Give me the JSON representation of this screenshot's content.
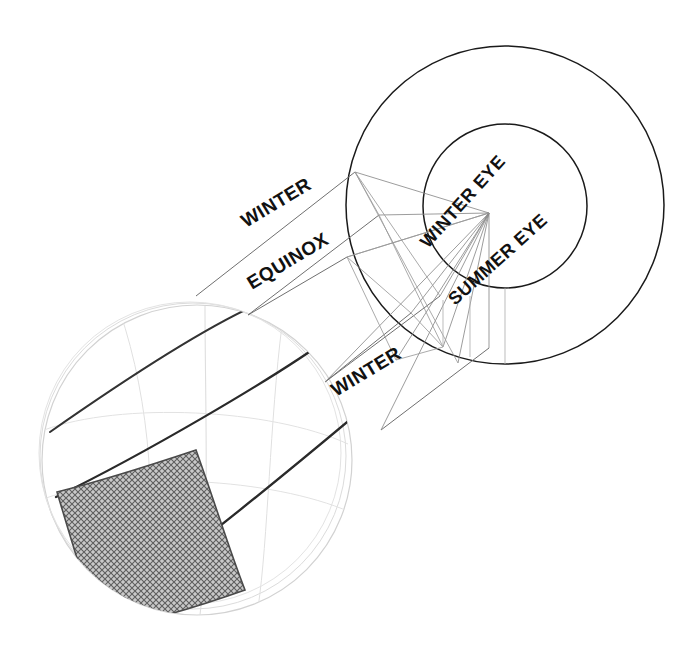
{
  "figure": {
    "type": "line-diagram",
    "background": "#ffffff",
    "width": 690,
    "height": 657
  },
  "colors": {
    "ink_dark": "#1a1a1a",
    "ink_mid": "#555555",
    "ink_light": "#9a9a9a",
    "ink_faint": "#cfcfcf",
    "hatch": "#6e6e6e",
    "hatch_fill": "#bdbdbd"
  },
  "labels": {
    "winter_upper": "WINTER",
    "equinox": "EQUINOX",
    "winter_lower": "WINTER",
    "winter_eye": "WINTER EYE",
    "summer_eye": "SUMMER EYE"
  },
  "label_geometry": [
    {
      "name": "winter-upper",
      "text": "WINTER",
      "x": 246,
      "y": 228,
      "rotate": -31,
      "size": 19
    },
    {
      "name": "equinox",
      "text": "EQUINOX",
      "x": 252,
      "y": 290,
      "rotate": -31,
      "size": 19
    },
    {
      "name": "winter-lower",
      "text": "WINTER",
      "x": 336,
      "y": 397,
      "rotate": -31,
      "size": 19
    },
    {
      "name": "winter-eye",
      "text": "WINTER EYE",
      "x": 428,
      "y": 249,
      "rotate": -48,
      "size": 18
    },
    {
      "name": "summer-eye",
      "text": "SUMMER EYE",
      "x": 455,
      "y": 306,
      "rotate": -42,
      "size": 18
    }
  ],
  "circles": {
    "outer": {
      "cx": 505,
      "cy": 205,
      "r": 159,
      "stroke": "#1a1a1a",
      "width": 1.6
    },
    "inner": {
      "cx": 505,
      "cy": 206,
      "r": 82,
      "stroke": "#1a1a1a",
      "width": 1.6
    }
  },
  "focal_point": {
    "x": 489,
    "y": 213,
    "name": "eye-vertex"
  },
  "sphere": {
    "cx": 197,
    "cy": 460,
    "r": 155,
    "outline_stroke": "#c8c8c8",
    "shell_offsets": [
      0,
      4,
      8
    ]
  },
  "hatched_patch": {
    "name": "shadow-patch",
    "fill": "#bdbdbd",
    "stroke": "#4a4a4a",
    "pattern": "cross-hatch",
    "corners": [
      [
        57,
        492
      ],
      [
        193,
        452
      ],
      [
        243,
        588
      ],
      [
        96,
        630
      ]
    ]
  },
  "band_edges": [
    {
      "name": "winter-upper-edge",
      "from": [
        196,
        296
      ],
      "to": [
        355,
        172
      ]
    },
    {
      "name": "equinox-upper-edge",
      "from": [
        248,
        315
      ],
      "to": [
        379,
        215
      ]
    },
    {
      "name": "winter-lower-edge",
      "from": [
        325,
        382
      ],
      "to": [
        440,
        296
      ]
    },
    {
      "name": "winter-lower-edge-2",
      "from": [
        381,
        430
      ],
      "to": [
        489,
        348
      ]
    }
  ],
  "ray_fan": {
    "origin": [
      489,
      213
    ],
    "endpoints": [
      [
        355,
        172
      ],
      [
        379,
        215
      ],
      [
        347,
        257
      ],
      [
        440,
        296
      ],
      [
        489,
        348
      ],
      [
        443,
        347
      ],
      [
        411,
        313
      ],
      [
        396,
        360
      ],
      [
        458,
        363
      ],
      [
        505,
        364
      ],
      [
        381,
        430
      ],
      [
        325,
        382
      ]
    ]
  },
  "cross_lines": [
    {
      "from": [
        355,
        172
      ],
      "to": [
        440,
        296
      ]
    },
    {
      "from": [
        355,
        172
      ],
      "to": [
        505,
        364
      ]
    },
    {
      "from": [
        379,
        215
      ],
      "to": [
        458,
        363
      ]
    },
    {
      "from": [
        347,
        257
      ],
      "to": [
        489,
        213
      ]
    },
    {
      "from": [
        411,
        313
      ],
      "to": [
        489,
        213
      ]
    },
    {
      "from": [
        443,
        347
      ],
      "to": [
        489,
        213
      ]
    }
  ]
}
